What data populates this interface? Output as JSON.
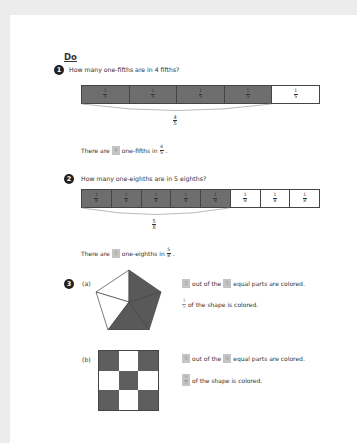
{
  "heading": "Do",
  "questions": [
    {
      "number": "1",
      "prompt": "How many one-fifths are in 4 fifths?",
      "bar": {
        "cells": 5,
        "shaded": 4,
        "unit_num": "1",
        "unit_den": "5"
      },
      "brace_label": {
        "num": "4",
        "den": "5"
      },
      "sentence": {
        "pre": "There are",
        "answer": "4",
        "post": "one-fifths in",
        "frac_num": "4",
        "frac_den": "5"
      }
    },
    {
      "number": "2",
      "prompt": "How many one-eighths are in 5 eighths?",
      "bar": {
        "cells": 8,
        "shaded": 5,
        "unit_num": "1",
        "unit_den": "8"
      },
      "brace_label": {
        "num": "5",
        "den": "8"
      },
      "sentence": {
        "pre": "There are",
        "answer": "5",
        "post": "one-eighths in",
        "frac_num": "5",
        "frac_den": "8"
      }
    },
    {
      "number": "3",
      "parts": [
        {
          "label": "(a)",
          "shape": "pentagon",
          "colored_parts": 3,
          "total_parts": 5,
          "line1": {
            "answer1": "3",
            "mid": "out of the",
            "answer2": "5",
            "post": "equal parts are colored."
          },
          "line2": {
            "frac_num": "3",
            "frac_den": "5",
            "post": "of the shape is colored."
          }
        },
        {
          "label": "(b)",
          "shape": "3x3 grid",
          "colored_parts": 5,
          "total_parts": 9,
          "line1": {
            "answer1": "5",
            "mid": "out of the",
            "answer2": "9",
            "post": "equal parts are colored."
          },
          "line2": {
            "frac_num": "5",
            "frac_den": "9",
            "post": "of the shape is colored."
          }
        }
      ]
    }
  ],
  "colors": {
    "background": "#ececec",
    "page": "#ffffff",
    "shaded": "#6e6e6e",
    "answer_box": "#c4c4c4"
  }
}
